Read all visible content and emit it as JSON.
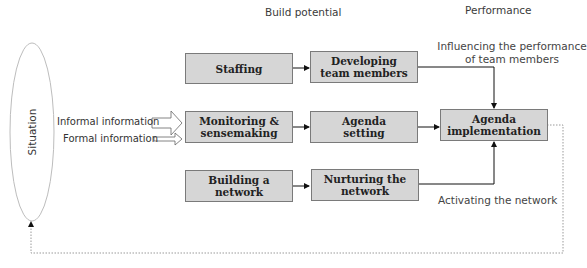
{
  "headers": {
    "build_potential": "Build potential",
    "performance": "Performance"
  },
  "situation": {
    "label": "Situation"
  },
  "inputs": {
    "informal": "Informal information",
    "formal": "Formal information"
  },
  "boxes": {
    "staffing": "Staffing",
    "monitoring": "Monitoring & sensemaking",
    "building": "Building a network",
    "developing": "Developing team members",
    "agenda_setting": "Agenda setting",
    "nurturing": "Nurturing the network",
    "agenda_implementation": "Agenda implementation"
  },
  "notes": {
    "influencing": "Influencing the performance of team members",
    "activating": "Activating the network"
  },
  "colors": {
    "box_fill": "#d6d6d6",
    "box_border": "#7a7a7a",
    "loop_line": "#9a9a9a"
  }
}
